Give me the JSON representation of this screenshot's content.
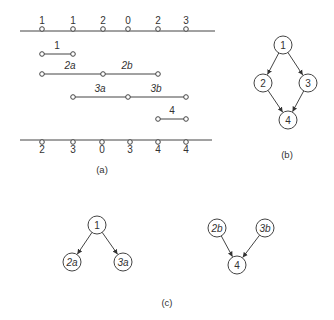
{
  "panel_a": {
    "caption": "(a)",
    "top_axis": {
      "y": 31,
      "x_start": 20,
      "x_end": 215,
      "points": [
        {
          "x": 42,
          "label": "1"
        },
        {
          "x": 73,
          "label": "1"
        },
        {
          "x": 103,
          "label": "2"
        },
        {
          "x": 128,
          "label": "0"
        },
        {
          "x": 158,
          "label": "2"
        },
        {
          "x": 186,
          "label": "3"
        }
      ]
    },
    "bottom_axis": {
      "y": 140,
      "x_start": 20,
      "x_end": 212,
      "points": [
        {
          "x": 42,
          "label": "2"
        },
        {
          "x": 73,
          "label": "3"
        },
        {
          "x": 102,
          "label": "0"
        },
        {
          "x": 130,
          "label": "3"
        },
        {
          "x": 158,
          "label": "4"
        },
        {
          "x": 186,
          "label": "4"
        }
      ]
    },
    "segments": [
      {
        "y": 54,
        "points": [
          42,
          73
        ],
        "labels": [
          {
            "text": "1",
            "x": 57
          }
        ]
      },
      {
        "y": 74,
        "points": [
          42,
          103,
          158
        ],
        "labels": [
          {
            "text": "2a",
            "x": 70
          },
          {
            "text": "2b",
            "x": 127
          }
        ]
      },
      {
        "y": 97,
        "points": [
          73,
          128,
          186
        ],
        "labels": [
          {
            "text": "3a",
            "x": 100
          },
          {
            "text": "3b",
            "x": 156
          }
        ]
      },
      {
        "y": 119,
        "points": [
          158,
          186
        ],
        "labels": [
          {
            "text": "4",
            "x": 172
          }
        ]
      }
    ]
  },
  "panel_b": {
    "caption": "(b)",
    "nodes": [
      {
        "id": "1",
        "label": "1",
        "x": 283,
        "y": 45
      },
      {
        "id": "2",
        "label": "2",
        "x": 263,
        "y": 83
      },
      {
        "id": "3",
        "label": "3",
        "x": 308,
        "y": 83
      },
      {
        "id": "4",
        "label": "4",
        "x": 288,
        "y": 120
      }
    ],
    "edges": [
      {
        "from": "1",
        "to": "2"
      },
      {
        "from": "1",
        "to": "3"
      },
      {
        "from": "2",
        "to": "4"
      },
      {
        "from": "3",
        "to": "4"
      }
    ]
  },
  "panel_c": {
    "caption": "(c)",
    "left_graph": {
      "nodes": [
        {
          "id": "1",
          "label": "1",
          "x": 97,
          "y": 225
        },
        {
          "id": "2a",
          "label": "2a",
          "x": 72,
          "y": 262
        },
        {
          "id": "3a",
          "label": "3a",
          "x": 123,
          "y": 262
        }
      ],
      "edges": [
        {
          "from": "1",
          "to": "2a"
        },
        {
          "from": "1",
          "to": "3a"
        }
      ]
    },
    "right_graph": {
      "nodes": [
        {
          "id": "2b",
          "label": "2b",
          "x": 217,
          "y": 228
        },
        {
          "id": "3b",
          "label": "3b",
          "x": 265,
          "y": 228
        },
        {
          "id": "4",
          "label": "4",
          "x": 237,
          "y": 265
        }
      ],
      "edges": [
        {
          "from": "2b",
          "to": "4"
        },
        {
          "from": "3b",
          "to": "4"
        }
      ]
    }
  }
}
